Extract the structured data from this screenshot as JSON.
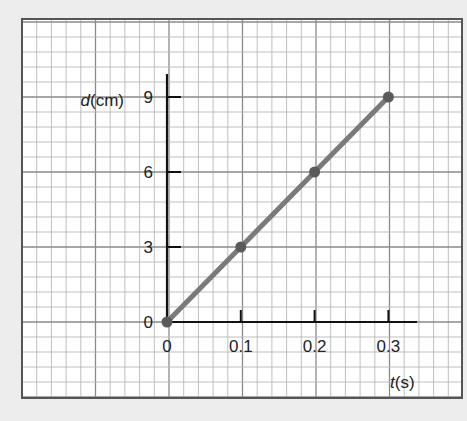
{
  "chart_data": {
    "type": "line",
    "title": "",
    "xlabel": "t(s)",
    "ylabel": "d(cm)",
    "xlabel_var": "t",
    "xlabel_unit": "(s)",
    "ylabel_var": "d",
    "ylabel_unit": "(cm)",
    "x": [
      0,
      0.1,
      0.2,
      0.3
    ],
    "series": [
      {
        "name": "d vs t",
        "values": [
          0,
          3,
          6,
          9
        ]
      }
    ],
    "x_ticks": [
      "0",
      "0.1",
      "0.2",
      "0.3"
    ],
    "y_ticks": [
      "0",
      "3",
      "6",
      "9"
    ],
    "xlim": [
      0,
      0.34
    ],
    "ylim": [
      0,
      10.3
    ],
    "grid": true,
    "legend": "none",
    "colors": {
      "background": "#ededed",
      "paper": "#ffffff",
      "grid_minor": "#b8b8b8",
      "grid_major": "#8a8a8a",
      "border": "#555555",
      "axis": "#111111",
      "line": "#7a7a7a",
      "marker": "#5a5a5a"
    }
  }
}
